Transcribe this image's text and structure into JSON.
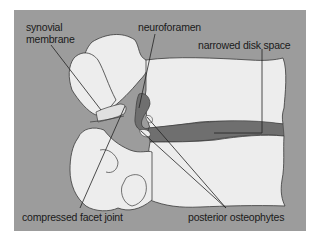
{
  "diagram": {
    "colors": {
      "background_panel": "#9c9c9c",
      "bone": "#ededed",
      "disk": "#6f6f6f",
      "outline": "#3a3a3a",
      "label_text": "#1a1a1a"
    },
    "labels": {
      "synovial_line1": "synovial",
      "synovial_line2": "membrane",
      "neuroforamen": "neuroforamen",
      "narrowed_disk_space": "narrowed disk space",
      "compressed_facet_joint": "compressed facet joint",
      "posterior_osteophytes": "posterior osteophytes"
    }
  }
}
